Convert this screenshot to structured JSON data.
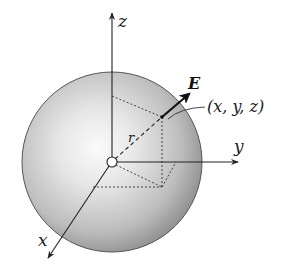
{
  "diagram": {
    "type": "3d-coordinate-sphere",
    "labels": {
      "z_axis": "z",
      "y_axis": "y",
      "x_axis": "x",
      "radius": "r",
      "field": "E",
      "point": "(x, y, z)"
    },
    "colors": {
      "sphere_light": "#f4f4f4",
      "sphere_dark": "#8e8e8e",
      "line": "#222222",
      "background": "#ffffff"
    }
  }
}
